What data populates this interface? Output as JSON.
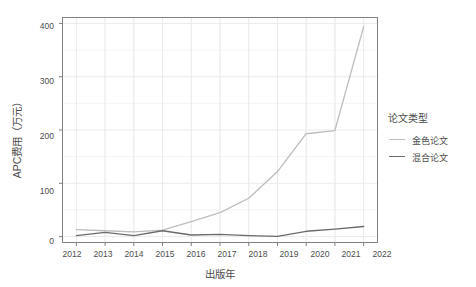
{
  "chart_data": {
    "type": "line",
    "title": "",
    "xlabel": "出版年",
    "ylabel": "APC费用（万元）",
    "x": [
      2012,
      2013,
      2014,
      2015,
      2016,
      2017,
      2018,
      2019,
      2020,
      2021,
      2022
    ],
    "xtick_labels": [
      "2012",
      "2013",
      "2014",
      "2015",
      "2016",
      "2017",
      "2018",
      "2019",
      "2020",
      "2021",
      "2022"
    ],
    "ytick_labels": [
      "0",
      "100",
      "200",
      "300",
      "400"
    ],
    "yticks": [
      0,
      100,
      200,
      300,
      400
    ],
    "xlim": [
      2011.5,
      2022.5
    ],
    "ylim": [
      -12,
      412
    ],
    "grid": true,
    "legend_position": "right",
    "legend_title": "论文类型",
    "series": [
      {
        "name": "金色论文",
        "color": "#bdbdbd",
        "values": [
          13,
          11,
          9,
          12,
          28,
          45,
          72,
          122,
          193,
          199,
          394
        ]
      },
      {
        "name": "混合论文",
        "color": "#6b6b6b",
        "values": [
          2,
          8,
          2,
          11,
          3,
          4,
          2,
          0.5,
          10,
          14,
          19
        ]
      }
    ]
  },
  "panel": {
    "background": "#ffffff",
    "border_color": "#808080",
    "grid_color": "#ebebeb"
  }
}
